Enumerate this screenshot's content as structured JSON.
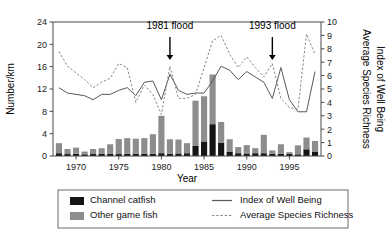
{
  "chart_data": {
    "type": "bar",
    "title": "",
    "xlabel": "Year",
    "ylabel": "Number/km",
    "y2label_1": "Index of Well Being",
    "y2label_2": "Average Species Richness",
    "xlim": [
      1967.3,
      1998.7
    ],
    "ylim": [
      0,
      24
    ],
    "y2lim": [
      0,
      10
    ],
    "grid": false,
    "legend_position": "below-axes",
    "xticks": [
      1970,
      1975,
      1980,
      1985,
      1990,
      1995
    ],
    "yticks": [
      0,
      4,
      8,
      12,
      16,
      20,
      24
    ],
    "y2ticks": [
      0,
      1,
      2,
      3,
      4,
      5,
      6,
      7,
      8,
      9,
      10
    ],
    "x": [
      1968,
      1969,
      1970,
      1971,
      1972,
      1973,
      1974,
      1975,
      1976,
      1977,
      1978,
      1979,
      1980,
      1981,
      1982,
      1983,
      1984,
      1985,
      1986,
      1987,
      1988,
      1989,
      1990,
      1991,
      1992,
      1993,
      1994,
      1995,
      1996,
      1997,
      1998
    ],
    "series": [
      {
        "name": "Channel catfish",
        "type": "bar-stack-bottom",
        "color": "#151515",
        "axis": "left",
        "values": [
          0.5,
          0.35,
          0.4,
          0.3,
          0.35,
          0.4,
          0.4,
          0.35,
          0.4,
          0.4,
          0.4,
          0.4,
          0.5,
          0.4,
          0.45,
          0.5,
          1.8,
          2.6,
          5.7,
          2.4,
          0.8,
          0.5,
          0.45,
          0.5,
          0.5,
          0.4,
          0.4,
          0.4,
          0.3,
          1.2,
          0.8
        ]
      },
      {
        "name": "Other game fish",
        "type": "bar-stack-top",
        "color": "#8d8d8d",
        "axis": "left",
        "values": [
          1.8,
          0.9,
          1.1,
          0.5,
          0.9,
          1.0,
          1.7,
          2.7,
          2.8,
          2.7,
          2.8,
          3.5,
          6.7,
          2.6,
          2.5,
          1.8,
          8.1,
          8.1,
          8.9,
          3.7,
          2.2,
          1.1,
          1.5,
          0.9,
          3.3,
          0.6,
          1.7,
          0.3,
          1.6,
          2.1,
          1.9
        ]
      },
      {
        "name": "Index of Well Being",
        "type": "line",
        "style": "solid",
        "color": "#585858",
        "axis": "right",
        "values": [
          5.1,
          4.7,
          4.6,
          4.5,
          4.2,
          4.6,
          4.6,
          4.9,
          5.1,
          4.5,
          5.5,
          5.6,
          4.2,
          6.1,
          4.9,
          4.6,
          4.7,
          4.7,
          5.6,
          6.7,
          6.4,
          5.7,
          6.3,
          5.9,
          5.5,
          4.3,
          6.6,
          4.2,
          3.3,
          3.3,
          6.3
        ]
      },
      {
        "name": "Average Species Richness",
        "type": "line",
        "style": "dashed",
        "color": "#8a8a8a",
        "axis": "right",
        "values": [
          7.8,
          6.7,
          6.2,
          5.7,
          5.1,
          5.5,
          5.8,
          6.9,
          6.6,
          4.0,
          5.3,
          4.6,
          3.1,
          6.7,
          4.3,
          4.3,
          4.6,
          6.6,
          8.6,
          9.0,
          7.6,
          6.6,
          7.4,
          6.6,
          5.9,
          6.9,
          4.3,
          3.6,
          3.5,
          9.1,
          7.6
        ]
      }
    ],
    "annotations": [
      {
        "text": "1981 flood",
        "x": 1981,
        "label_y": 23.2,
        "arrow_from_y": 21.3,
        "arrow_to_y": 17.2
      },
      {
        "text": "1993 flood",
        "x": 1993,
        "label_y": 23.2,
        "arrow_from_y": 21.3,
        "arrow_to_y": 17.2
      }
    ]
  },
  "legend": {
    "items": [
      {
        "label": "Channel catfish",
        "marker": "swatch-dark"
      },
      {
        "label": "Other game fish",
        "marker": "swatch-light"
      },
      {
        "label": "Index of Well Being",
        "marker": "line-solid"
      },
      {
        "label": "Average Species Richness",
        "marker": "line-dashed"
      }
    ]
  }
}
